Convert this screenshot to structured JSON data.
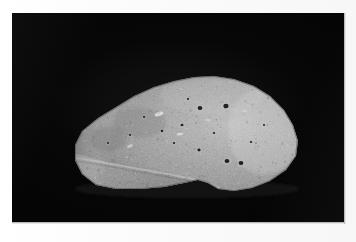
{
  "image": {
    "kind": "photograph",
    "subject": "rock-specimen",
    "caption": "Gray rock specimen photographed against a black background",
    "width": 356,
    "height": 242,
    "orientation": "landscape"
  },
  "frame": {
    "border_color": "#ffffff",
    "border_width_px": 12,
    "background_color": "#050505"
  },
  "plate": {
    "left": 12,
    "top": 13,
    "width": 332,
    "height": 209
  },
  "specimen": {
    "name": "rock-specimen",
    "description": "Elongated wedge-shaped stone, broad and rounded at the right, tapering to a blunt point at the left, with a pitted upper surface and a smooth lower facet separated by a ridge.",
    "body_color": "#9a9a9a",
    "highlight_color": "#c9c9c9",
    "shadow_color": "#5c5c5c",
    "facet_color": "#8a8a8a",
    "outline": "M 63,132 L 70,118 L 86,105 L 104,94 L 122,83 L 142,74 L 162,68 L 182,64 L 202,63 L 222,66 L 242,73 L 258,83 L 272,97 L 281,112 L 286,128 L 284,143 L 274,157 L 258,168 L 240,175 L 222,178 L 206,176 L 196,170 L 186,167 L 172,170 L 152,174 L 128,176 L 104,176 L 84,172 L 70,161 L 63,147 Z",
    "ridge_path": "M 64,146 C 92,150 120,156 150,161 C 178,166 196,169 206,175",
    "pits": [
      {
        "cx": 188,
        "cy": 95,
        "r": 2.4,
        "name": "pit-1"
      },
      {
        "cx": 214,
        "cy": 93,
        "r": 2.6,
        "name": "pit-2"
      },
      {
        "cx": 170,
        "cy": 112,
        "r": 1.5,
        "name": "pit-3"
      },
      {
        "cx": 187,
        "cy": 137,
        "r": 1.6,
        "name": "pit-4"
      },
      {
        "cx": 215,
        "cy": 148,
        "r": 2.4,
        "name": "pit-5"
      },
      {
        "cx": 229,
        "cy": 150,
        "r": 2.4,
        "name": "pit-6"
      },
      {
        "cx": 150,
        "cy": 118,
        "r": 1.3,
        "name": "pit-7"
      },
      {
        "cx": 162,
        "cy": 130,
        "r": 1.2,
        "name": "pit-8"
      },
      {
        "cx": 132,
        "cy": 104,
        "r": 1.1,
        "name": "pit-9"
      },
      {
        "cx": 202,
        "cy": 120,
        "r": 1.2,
        "name": "pit-10"
      },
      {
        "cx": 239,
        "cy": 129,
        "r": 1.2,
        "name": "pit-11"
      },
      {
        "cx": 118,
        "cy": 122,
        "r": 1.1,
        "name": "pit-12"
      },
      {
        "cx": 96,
        "cy": 130,
        "r": 1.0,
        "name": "pit-13"
      },
      {
        "cx": 176,
        "cy": 86,
        "r": 1.1,
        "name": "pit-14"
      },
      {
        "cx": 252,
        "cy": 112,
        "r": 1.0,
        "name": "pit-15"
      }
    ],
    "speckles_count": 420
  }
}
